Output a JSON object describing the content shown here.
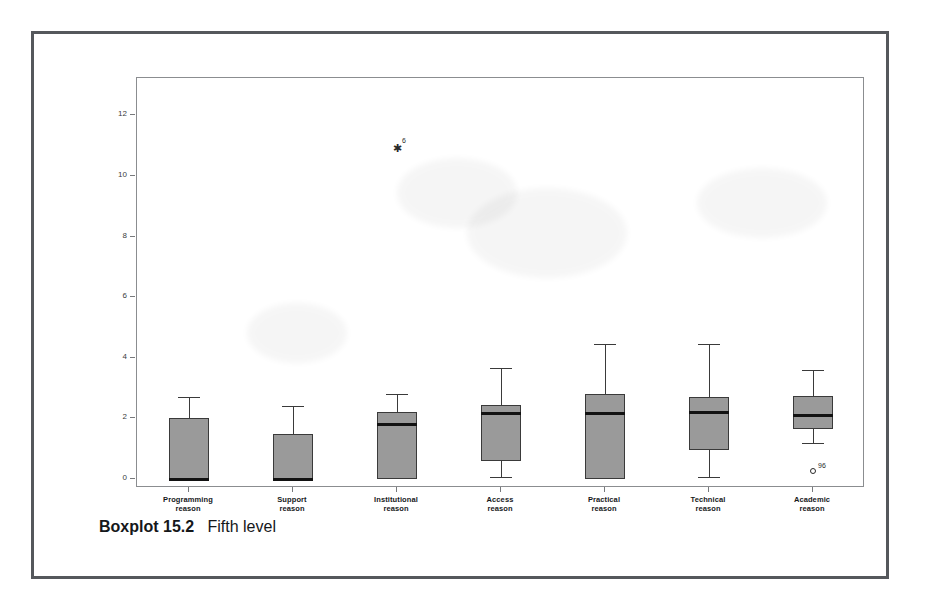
{
  "figure": {
    "caption_label": "Boxplot 15.2",
    "caption_title": "Fifth level"
  },
  "chart_data": {
    "type": "box",
    "title": "",
    "xlabel": "",
    "ylabel": "",
    "ylim": [
      -0.35,
      12.75
    ],
    "yticks": [
      0,
      2,
      4,
      6,
      8,
      10,
      12
    ],
    "ytick_labels": [
      "0",
      "2",
      "4",
      "6",
      "8",
      "10",
      "12"
    ],
    "grid": false,
    "legend": "none",
    "categories": [
      "Programming\nreason",
      "Support\nreason",
      "Institutional\nreason",
      "Access\nreason",
      "Practical\nreason",
      "Technical\nreason",
      "Academic\nreason"
    ],
    "category_lines": [
      [
        "Programming",
        "reason"
      ],
      [
        "Support",
        "reason"
      ],
      [
        "Institutional",
        "reason"
      ],
      [
        "Access",
        "reason"
      ],
      [
        "Practical",
        "reason"
      ],
      [
        "Technical",
        "reason"
      ],
      [
        "Academic",
        "reason"
      ]
    ],
    "boxes": [
      {
        "category": "Programming reason",
        "whisker_low": 0.0,
        "q1": 0.0,
        "median": 0.0,
        "q3": 2.0,
        "whisker_high": 2.7,
        "outliers": []
      },
      {
        "category": "Support reason",
        "whisker_low": 0.0,
        "q1": 0.0,
        "median": 0.0,
        "q3": 1.5,
        "whisker_high": 2.4,
        "outliers": []
      },
      {
        "category": "Institutional reason",
        "whisker_low": 0.0,
        "q1": 0.0,
        "median": 1.8,
        "q3": 2.2,
        "whisker_high": 2.8,
        "outliers": [
          {
            "value": 11.0,
            "marker": "star",
            "label": "6"
          }
        ]
      },
      {
        "category": "Access reason",
        "whisker_low": 0.05,
        "q1": 0.6,
        "median": 2.15,
        "q3": 2.45,
        "whisker_high": 3.65,
        "outliers": []
      },
      {
        "category": "Practical reason",
        "whisker_low": 0.0,
        "q1": 0.0,
        "median": 2.15,
        "q3": 2.8,
        "whisker_high": 4.45,
        "outliers": []
      },
      {
        "category": "Technical reason",
        "whisker_low": 0.05,
        "q1": 0.95,
        "median": 2.2,
        "q3": 2.7,
        "whisker_high": 4.45,
        "outliers": []
      },
      {
        "category": "Academic reason",
        "whisker_low": 1.2,
        "q1": 1.65,
        "median": 2.1,
        "q3": 2.75,
        "whisker_high": 3.6,
        "outliers": [
          {
            "value": 0.25,
            "marker": "circle",
            "label": "96"
          }
        ]
      }
    ],
    "colors": {
      "box_fill": "#9a9a9a",
      "box_edge": "#3a3a3a",
      "median": "#121212",
      "axis": "#8b8d90",
      "text": "#16181a",
      "frame": "#55585c"
    }
  }
}
